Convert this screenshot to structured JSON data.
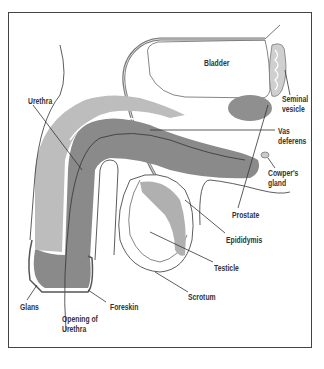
{
  "diagram": {
    "colors": {
      "shaft_light": "#bdbdbd",
      "shaft_dark": "#8a8a8a",
      "prostate": "#8f8f8f",
      "testicle_shade": "#b0b0b0",
      "line": "#333333",
      "frame": "#444444"
    },
    "labels": {
      "bladder": "Bladder",
      "seminal_vesicle": "Seminal\nvesicle",
      "urethra": "Urethra",
      "vas_deferens": "Vas\ndeferens",
      "cowpers_gland": "Cowper's\ngland",
      "prostate": "Prostate",
      "epididymis": "Epididymis",
      "testicle": "Testicle",
      "scrotum": "Scrotum",
      "glans": "Glans",
      "opening_of_urethra": "Opening of\nUrethra",
      "foreskin": "Foreskin"
    }
  }
}
